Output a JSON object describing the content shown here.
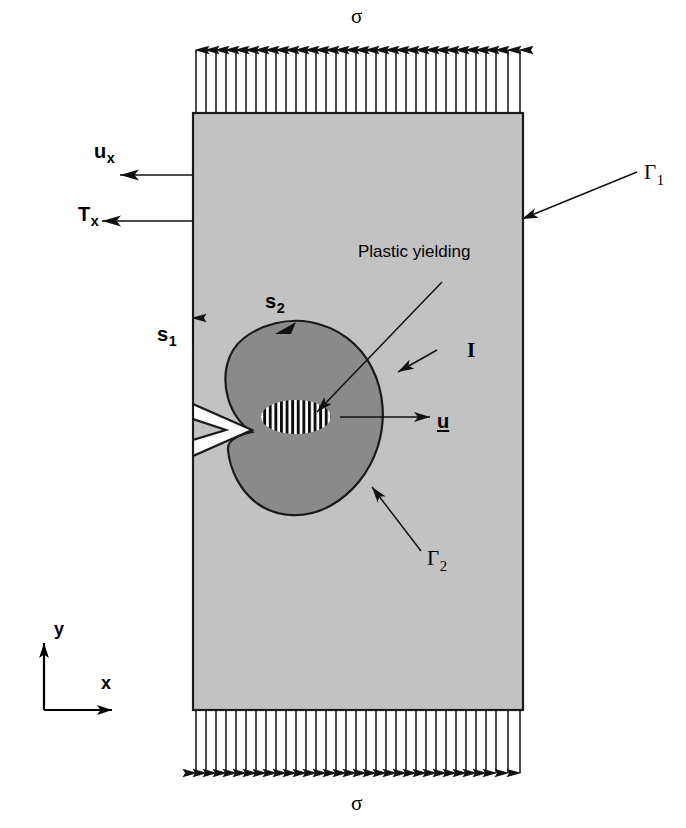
{
  "figure": {
    "background_color": "#ffffff"
  },
  "plate": {
    "name": "elastic plate",
    "fill_color": "#c2c2c2",
    "edge_color": "#1a1a1a",
    "x": 193,
    "y": 113,
    "width": 330,
    "height": 597
  },
  "plastic_zone": {
    "name": "plastic yielding zone",
    "fill_color": "#8a8a8a",
    "edge_color": "#1a1a1a"
  },
  "process_zone": {
    "name": "hatched process zone",
    "hatch_color": "#000000",
    "background_color": "#ffffff"
  },
  "crack": {
    "name": "edge crack notch",
    "fill_color": "#ffffff",
    "edge_color": "#1a1a1a"
  },
  "loads": {
    "top_label": "σ",
    "bottom_label": "σ",
    "arrow_count": 33,
    "arrow_color": "#111111",
    "direction_top": "up",
    "direction_bottom": "down"
  },
  "labels": {
    "displacement_bc": {
      "symbol": "u",
      "subscript": "x"
    },
    "traction_bc": {
      "symbol": "T",
      "subscript": "x"
    },
    "contour_s1": {
      "symbol": "s",
      "subscript": "1"
    },
    "contour_s2": {
      "symbol": "s",
      "subscript": "2"
    },
    "gamma1": {
      "symbol": "Γ",
      "subscript": "1"
    },
    "gamma2": {
      "symbol": "Γ",
      "subscript": "2"
    },
    "plastic_yielding": "Plastic yielding",
    "integral_I": "I",
    "displacement_vector": "u"
  },
  "axes": {
    "x_label": "x",
    "y_label": "y",
    "color": "#000000"
  }
}
